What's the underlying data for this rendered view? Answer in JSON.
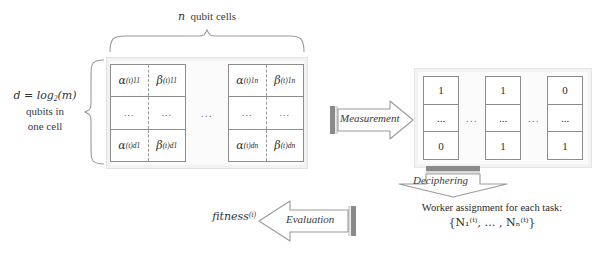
{
  "diagram": {
    "colors": {
      "cell_border": "#8d8d8d",
      "container_fill": "#fbfbfb",
      "container_border": "#e2e2e2",
      "arrow_outline": "#9a9a9a",
      "arrow_bar": "#8a8a8a",
      "text": "#2b2b2b"
    }
  },
  "labels": {
    "n_qubit_cells": "n qubit cells",
    "d_line1": "d = log",
    "d_sub": "2",
    "d_line1_tail": "(m)",
    "d_line2": "qubits in",
    "d_line3": "one cell",
    "fitness": "fitness",
    "fitness_sup": "(t)",
    "worker_line1": "Worker assignment for each task:",
    "worker_line2": "{N₁⁽ᵗ⁾, … , Nₙ⁽ᵗ⁾}"
  },
  "arrows": {
    "measurement": "Measurement",
    "evaluation": "Evaluation",
    "deciphering": "Deciphering"
  },
  "qubit_matrix": {
    "ellipsis": "...",
    "blocks": [
      {
        "id": "first-cell-block",
        "rows": [
          {
            "alpha": "α",
            "alpha_sub": "11",
            "alpha_sup": "(t)",
            "beta": "β",
            "beta_sub": "11",
            "beta_sup": "(t)"
          },
          {
            "alpha": "...",
            "alpha_sub": "",
            "alpha_sup": "",
            "beta": "...",
            "beta_sub": "",
            "beta_sup": ""
          },
          {
            "alpha": "α",
            "alpha_sub": "d1",
            "alpha_sup": "(t)",
            "beta": "β",
            "beta_sub": "d1",
            "beta_sup": "(t)"
          }
        ]
      },
      {
        "id": "last-cell-block",
        "rows": [
          {
            "alpha": "α",
            "alpha_sub": "1n",
            "alpha_sup": "(t)",
            "beta": "β",
            "beta_sub": "1n",
            "beta_sup": "(t)"
          },
          {
            "alpha": "...",
            "alpha_sub": "",
            "alpha_sup": "",
            "beta": "...",
            "beta_sub": "",
            "beta_sup": ""
          },
          {
            "alpha": "α",
            "alpha_sub": "dn",
            "alpha_sup": "(t)",
            "beta": "β",
            "beta_sub": "dn",
            "beta_sup": "(t)"
          }
        ]
      }
    ]
  },
  "bit_matrix": {
    "ellipsis": "...",
    "columns": [
      {
        "id": "bit-column-1",
        "top": "1",
        "middle": "...",
        "bottom": "0"
      },
      {
        "id": "bit-column-2",
        "top": "1",
        "middle": "...",
        "bottom": "1"
      },
      {
        "id": "bit-column-3",
        "top": "0",
        "middle": "...",
        "bottom": "1"
      }
    ]
  }
}
